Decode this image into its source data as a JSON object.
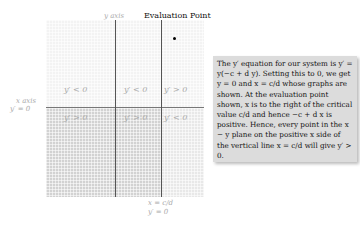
{
  "diagram": {
    "y_axis_label": "y axis",
    "x_axis_label": "x axis",
    "x_axis_equation": "y′ = 0",
    "vertical_line_eq1": "x = c/d",
    "vertical_line_eq2": "y′ = 0",
    "evaluation_point_label": "Evaluation Point",
    "regions": {
      "upper_left": "y′ < 0",
      "upper_middle": "y′ < 0",
      "upper_right": "y′ > 0",
      "lower_left": "y′ > 0",
      "lower_middle": "y′ > 0",
      "lower_right": "y′ < 0"
    }
  },
  "explanation": {
    "text": "The y′ equation for our system is y′ = y(−c + d y). Setting this to 0, we get y = 0 and x = c/d whose graphs are shown. At the evaluation point shown, x is to the right of the critical value c/d and hence −c + d x is positive. Hence, every point in the x − y plane on the positive x side of the vertical line x = c/d will give y′ > 0."
  },
  "colors": {
    "upper_region": "#f3f3f3",
    "lower_region": "#d2d2d2",
    "lower_right_region": "#e8e8e8",
    "textbox_bg": "#dcdcdc"
  }
}
